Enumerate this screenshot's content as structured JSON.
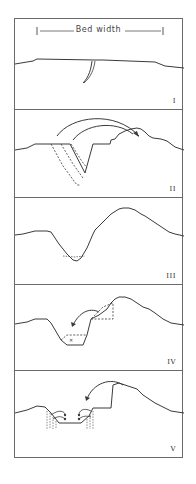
{
  "figure": {
    "bed_width_label": "Bed width",
    "panels": [
      {
        "id": "I",
        "label": "I"
      },
      {
        "id": "II",
        "label": "II"
      },
      {
        "id": "III",
        "label": "III"
      },
      {
        "id": "IV",
        "label": "IV"
      },
      {
        "id": "V",
        "label": "V"
      }
    ],
    "line_color": "#3a3a3a",
    "border_color": "#6a6a6a"
  }
}
